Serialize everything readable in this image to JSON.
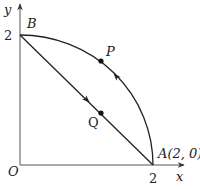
{
  "diagram": {
    "axes": {
      "x_label": "x",
      "y_label": "y",
      "origin_label": "O",
      "x_tick": "2",
      "y_tick": "2"
    },
    "points": {
      "A": {
        "label": "A(2, 0)",
        "x": 2,
        "y": 0
      },
      "B": {
        "label": "B",
        "x": 0,
        "y": 2
      },
      "P": {
        "label": "P",
        "on": "arc BA"
      },
      "Q": {
        "label": "Q",
        "on": "segment BA"
      }
    },
    "paths": [
      {
        "name": "arc",
        "from": "A",
        "to": "B",
        "type": "quarter-circle centered at O, radius 2",
        "direction": "A to B (counterclockwise)"
      },
      {
        "name": "chord",
        "from": "B",
        "to": "A",
        "type": "line segment",
        "direction": "B to A"
      }
    ],
    "colors": {
      "stroke": "#222222",
      "axis": "#555555",
      "background": "#ffffff"
    }
  }
}
